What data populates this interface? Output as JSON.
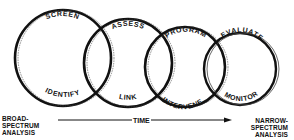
{
  "diagram": {
    "circles": [
      {
        "top_label": "SCREEN",
        "bottom_label": "IDENTIFY"
      },
      {
        "top_label": "ASSESS",
        "bottom_label": "LINK"
      },
      {
        "top_label": "PROGRAM",
        "bottom_label": "INTERVENE"
      },
      {
        "top_label": "EVALUATE",
        "bottom_label": "MONITOR"
      }
    ],
    "axis": {
      "left_label_lines": [
        "BROAD-",
        "SPECTRUM",
        "ANALYSIS"
      ],
      "center_label": "TIME",
      "right_label_lines": [
        "NARROW-",
        "SPECTRUM",
        "ANALYSIS"
      ]
    },
    "colors": {
      "ink": "#111111",
      "background": "#ffffff"
    }
  }
}
